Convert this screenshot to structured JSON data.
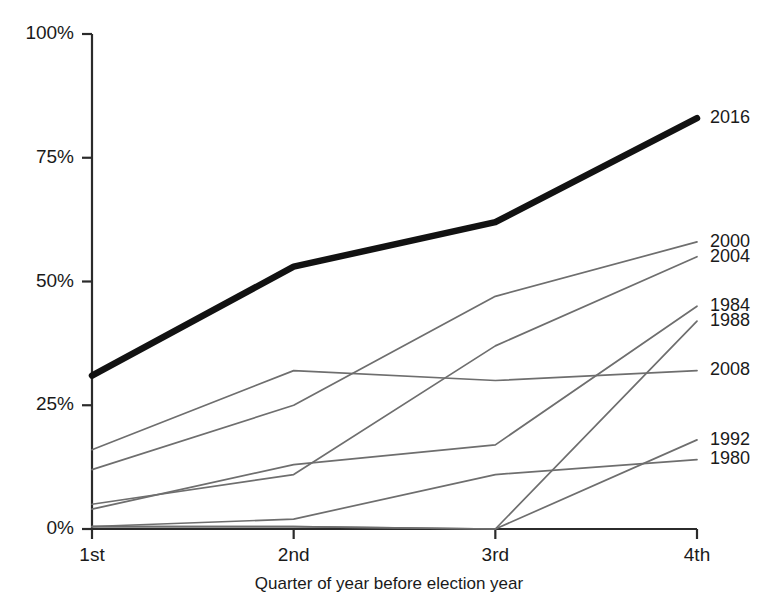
{
  "chart_data": {
    "type": "line",
    "title": "",
    "subtitle": "",
    "xlabel": "Quarter of year before election year",
    "ylabel": "",
    "categories": [
      "1st",
      "2nd",
      "3rd",
      "4th"
    ],
    "x_tick_labels": [
      "1st",
      "2nd",
      "3rd",
      "4th"
    ],
    "y_tick_labels": [
      "0%",
      "25%",
      "50%",
      "75%",
      "100%"
    ],
    "y_tick_values": [
      0,
      25,
      50,
      75,
      100
    ],
    "ylim": [
      0,
      100
    ],
    "grid": false,
    "legend_position": "right-inline-labels",
    "units": "percent",
    "series": [
      {
        "name": "2016",
        "label": "2016",
        "values": [
          31,
          53,
          62,
          83
        ],
        "highlight": true,
        "color": "#121212",
        "label_y_percent": 83
      },
      {
        "name": "2000",
        "label": "2000",
        "values": [
          12,
          25,
          47,
          58
        ],
        "highlight": false,
        "color": "#6e6e6e",
        "label_y_percent": 58
      },
      {
        "name": "2004",
        "label": "2004",
        "values": [
          5,
          11,
          37,
          55
        ],
        "highlight": false,
        "color": "#6e6e6e",
        "label_y_percent": 55
      },
      {
        "name": "1984",
        "label": "1984",
        "values": [
          4,
          13,
          17,
          45
        ],
        "highlight": false,
        "color": "#6e6e6e",
        "label_y_percent": 45
      },
      {
        "name": "1988",
        "label": "1988",
        "values": [
          0.5,
          0.5,
          0,
          42
        ],
        "highlight": false,
        "color": "#6e6e6e",
        "label_y_percent": 42
      },
      {
        "name": "2008",
        "label": "2008",
        "values": [
          16,
          32,
          30,
          32
        ],
        "highlight": false,
        "color": "#6e6e6e",
        "label_y_percent": 32
      },
      {
        "name": "1992",
        "label": "1992",
        "values": [
          0.5,
          0.5,
          0,
          18
        ],
        "highlight": false,
        "color": "#6e6e6e",
        "label_y_percent": 18
      },
      {
        "name": "1980",
        "label": "1980",
        "values": [
          0.5,
          2,
          11,
          14
        ],
        "highlight": false,
        "color": "#6e6e6e",
        "label_y_percent": 14
      }
    ]
  }
}
